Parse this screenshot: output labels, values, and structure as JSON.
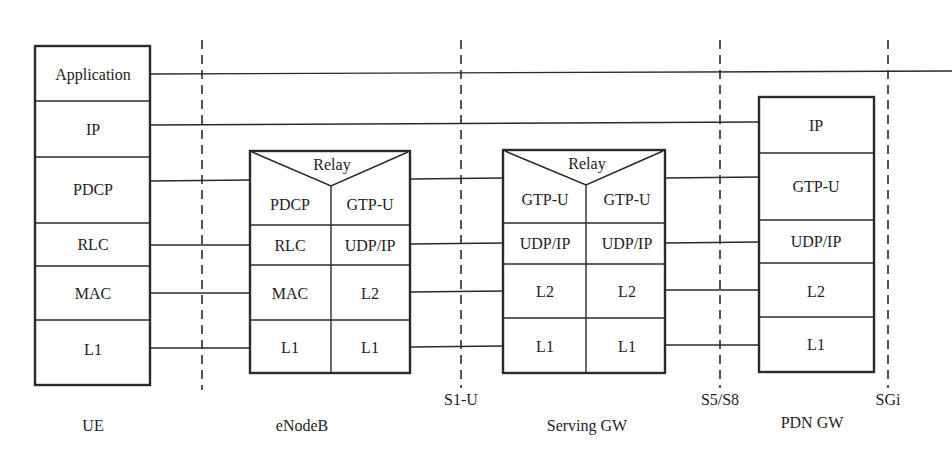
{
  "diagram": {
    "type": "protocol-stack",
    "nodes": [
      {
        "id": "ue",
        "label": "UE",
        "layers": [
          "Application",
          "IP",
          "PDCP",
          "RLC",
          "MAC",
          "L1"
        ]
      },
      {
        "id": "enodeb",
        "label": "eNodeB",
        "relay": "Relay",
        "left_layers": [
          "PDCP",
          "RLC",
          "MAC",
          "L1"
        ],
        "right_layers": [
          "GTP-U",
          "UDP/IP",
          "L2",
          "L1"
        ]
      },
      {
        "id": "serving-gw",
        "label": "Serving GW",
        "relay": "Relay",
        "left_layers": [
          "GTP-U",
          "UDP/IP",
          "L2",
          "L1"
        ],
        "right_layers": [
          "GTP-U",
          "UDP/IP",
          "L2",
          "L1"
        ]
      },
      {
        "id": "pdn-gw",
        "label": "PDN GW",
        "layers": [
          "IP",
          "GTP-U",
          "UDP/IP",
          "L2",
          "L1"
        ]
      }
    ],
    "interfaces": [
      {
        "id": "uu",
        "label": ""
      },
      {
        "id": "s1u",
        "label": "S1-U"
      },
      {
        "id": "s5s8",
        "label": "S5/S8"
      },
      {
        "id": "sgi",
        "label": "SGi"
      }
    ],
    "colors": {
      "line": "#2a2a2a",
      "background": "#ffffff",
      "text": "#222222"
    }
  }
}
